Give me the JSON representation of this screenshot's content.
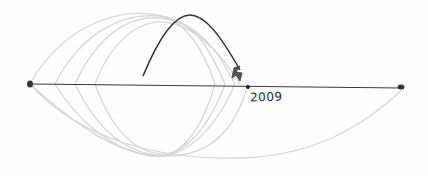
{
  "diagram": {
    "timeline": {
      "start_x": 30,
      "end_x": 402,
      "y": 84,
      "marker_x": 248,
      "marker_label": "2009"
    },
    "colors": {
      "line": "#3a3a3a",
      "faded_arc": "#d4d4d4",
      "dark_arc": "#333333",
      "background": "#fefefe"
    }
  }
}
